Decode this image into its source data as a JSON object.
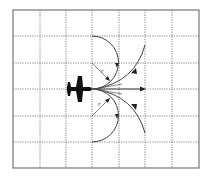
{
  "diagram": {
    "labels": {
      "radius_upper": "r",
      "radius_lower": "r"
    },
    "colors": {
      "background": "#ffffff",
      "grid": "#555555",
      "border": "#666666",
      "path": "#444444",
      "aircraft": "#111111"
    },
    "grid": {
      "columns": 7,
      "rows": 6
    },
    "elements": [
      "aircraft-icon",
      "straight-path-arrow",
      "upper-tight-turn-arc",
      "lower-tight-turn-arc",
      "upper-wide-turn-arc",
      "lower-wide-turn-arc",
      "upper-radius-line",
      "lower-radius-line"
    ]
  }
}
